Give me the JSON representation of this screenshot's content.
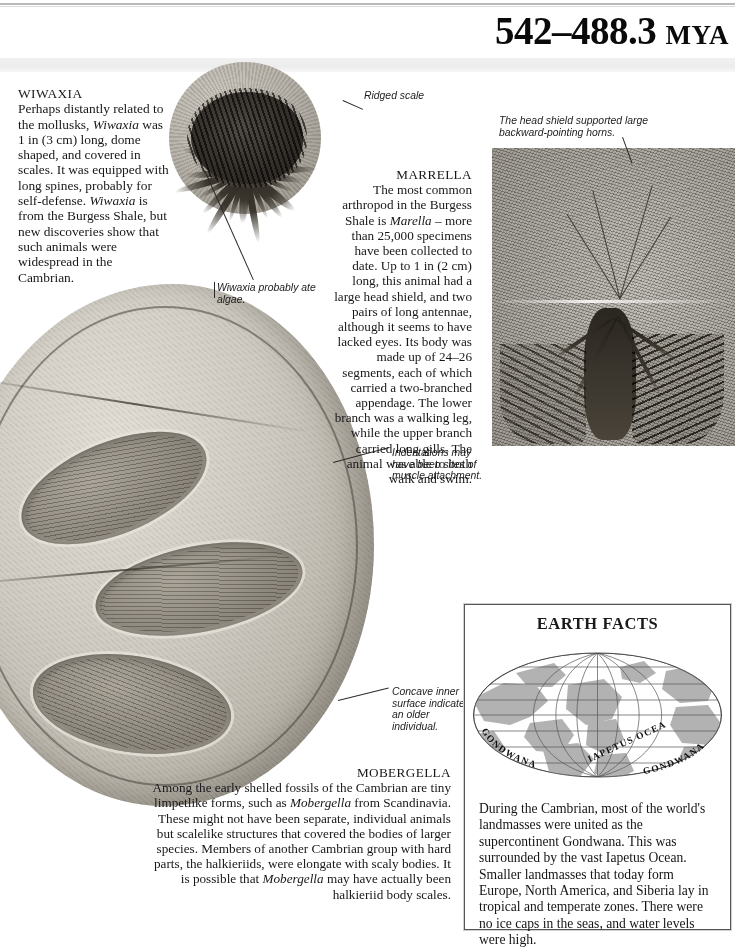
{
  "header": {
    "era_range": "542–488.3",
    "era_unit": "MYA"
  },
  "sections": {
    "wiwaxia": {
      "heading": "WIWAXIA",
      "body_html": "Perhaps distantly related to the mollusks, <i>Wiwaxia</i> was 1 in (3 cm) long, dome shaped, and covered in scales. It was equipped with long spines, probably for self-defense. <i>Wiwaxia</i> is from the Burgess Shale, but new discoveries show that such animals were widespread in the Cambrian."
    },
    "marrella": {
      "heading": "MARRELLA",
      "body_html": "The most common arthropod in the Burgess Shale is <i>Marella</i> – more than 25,000 specimens have been collected to date. Up to 1 in (2 cm) long, this animal had a large head shield, and two pairs of long antennae, although it seems to have lacked eyes. Its body was made up of 24–26 segments, each of which carried a two-branched appendage. The lower branch was a walking leg, while the upper branch carried long gills. The animal was able to both walk and swim."
    },
    "mobergella": {
      "heading": "MOBERGELLA",
      "body_html": "Among the early shelled fossils of the Cambrian are tiny limpetlike forms, such as <i>Mobergella</i> from Scandinavia. These might not have been separate, individual animals but scalelike structures that covered the bodies of larger species. Members of another Cambrian group with hard parts, the halkieriids, were elongate with scaly bodies. It is possible that <i>Mobergella</i> may have actually been halkieriid body scales."
    }
  },
  "annotations": {
    "ridged_scale": "Ridged scale",
    "wiwaxia_algae": "Wiwaxia probably ate algae.",
    "indentations": "Indentations may have been sites of muscle attachment.",
    "concave": "Concave inner surface indicates an older individual.",
    "head_shield": "The head shield supported large backward-pointing horns."
  },
  "earth_facts": {
    "title": "EARTH FACTS",
    "body": "During the Cambrian, most of the world's landmasses were united as the supercontinent Gondwana. This was surrounded by the vast Iapetus Ocean. Smaller landmasses that today form Europe, North America, and Siberia lay in tropical and temperate zones. There were no ice caps in the seas, and water levels were high.",
    "map": {
      "projection": "elliptical-mollweide",
      "labels": {
        "gondwana_left": "GONDWANA",
        "iapetus_ocean": "IAPETUS OCEAN",
        "gondwana_right": "GONDWANA"
      },
      "land_color": "#b0b0b0",
      "ocean_color": "#ffffff",
      "graticule_color": "#555555"
    }
  },
  "photos": {
    "wiwaxia": "wiwaxia-fossil-photo",
    "marrella": "marrella-fossil-photo",
    "mobergella": "mobergella-fossil-photo"
  }
}
